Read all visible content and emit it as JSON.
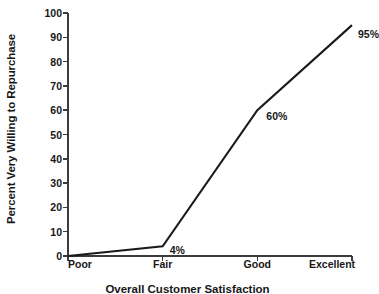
{
  "chart_data": {
    "type": "line",
    "title": "",
    "xlabel": "Overall Customer Satisfaction",
    "ylabel": "Percent Very Willing to Repurchase",
    "categories": [
      "Poor",
      "Fair",
      "Good",
      "Excellent"
    ],
    "values": [
      0,
      4,
      60,
      95
    ],
    "point_labels": [
      "",
      "4%",
      "60%",
      "95%"
    ],
    "ylim": [
      0,
      100
    ],
    "yticks": [
      0,
      10,
      20,
      30,
      40,
      50,
      60,
      70,
      80,
      90,
      100
    ],
    "ytick_labels": [
      "0",
      "10",
      "20",
      "30",
      "40",
      "50",
      "60",
      "70",
      "80",
      "90",
      "100"
    ],
    "grid": false,
    "legend": false,
    "series": [
      {
        "name": "Percent Very Willing to Repurchase",
        "values": [
          0,
          4,
          60,
          95
        ]
      }
    ],
    "colors": {
      "line": "#1a1a1a",
      "axis": "#3b3b3b",
      "text": "#171717",
      "background": "#ffffff"
    }
  },
  "axes": {
    "plot_left": 68,
    "plot_right": 352,
    "plot_top": 13,
    "plot_bottom": 256
  }
}
